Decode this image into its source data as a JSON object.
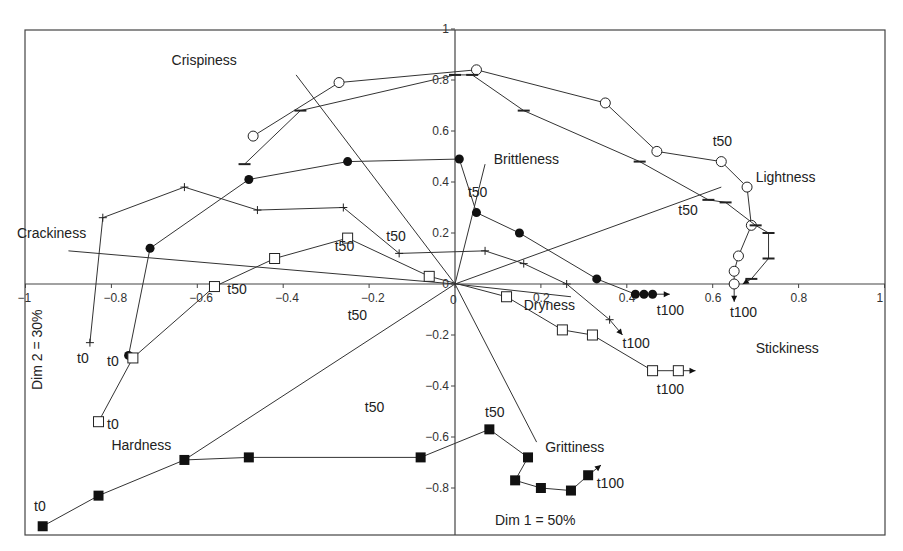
{
  "chart_data": {
    "type": "scatter",
    "subtype": "PCA biplot with time trajectories",
    "title": "",
    "xlabel": "Dim 1 = 50%",
    "ylabel": "Dim 2 = 30%",
    "xlim": [
      -1,
      1
    ],
    "ylim": [
      -1,
      1
    ],
    "grid": false,
    "legend": "none",
    "x_ticks": [
      "-1",
      "-0.8",
      "-0.6",
      "-0.4",
      "-0.2",
      "0",
      "0.2",
      "0.4",
      "0.6",
      "0.8",
      "1"
    ],
    "x_tick_values": [
      -1,
      -0.8,
      -0.6,
      -0.4,
      -0.2,
      0,
      0.2,
      0.4,
      0.6,
      0.8,
      1
    ],
    "y_ticks": [
      "1",
      "0.8",
      "0.6",
      "0.4",
      "0.2",
      "0",
      "-0.2",
      "-0.4",
      "-0.6",
      "-0.8"
    ],
    "y_tick_values": [
      1,
      0.8,
      0.6,
      0.4,
      0.2,
      0,
      -0.2,
      -0.4,
      -0.6,
      -0.8
    ],
    "attribute_vectors": [
      {
        "name": "Crispiness",
        "x": -0.37,
        "y": 0.82,
        "label_x": -0.66,
        "label_y": 0.86
      },
      {
        "name": "Brittleness",
        "x": 0.07,
        "y": 0.47,
        "label_x": 0.09,
        "label_y": 0.47
      },
      {
        "name": "Lightness",
        "x": 0.62,
        "y": 0.38,
        "label_x": 0.7,
        "label_y": 0.4
      },
      {
        "name": "Crackiness",
        "x": -0.9,
        "y": 0.13,
        "label_x": -1.02,
        "label_y": 0.18
      },
      {
        "name": "Dryness",
        "x": 0.27,
        "y": -0.05,
        "label_x": 0.16,
        "label_y": -0.1
      },
      {
        "name": "Grittiness",
        "x": 0.19,
        "y": -0.62,
        "label_x": 0.21,
        "label_y": -0.66
      },
      {
        "name": "Hardness",
        "x": -0.63,
        "y": -0.69,
        "label_x": -0.8,
        "label_y": -0.65
      },
      {
        "name": "Stickiness",
        "x": null,
        "y": null,
        "label_x": 0.7,
        "label_y": -0.27
      }
    ],
    "series": [
      {
        "name": "open-circle",
        "marker": "circle-open",
        "points": [
          [
            -0.47,
            0.58
          ],
          [
            -0.27,
            0.79
          ],
          [
            0.05,
            0.84
          ],
          [
            0.35,
            0.71
          ],
          [
            0.47,
            0.52
          ],
          [
            0.62,
            0.48
          ],
          [
            0.68,
            0.38
          ],
          [
            0.69,
            0.23
          ],
          [
            0.66,
            0.11
          ],
          [
            0.65,
            0.05
          ],
          [
            0.65,
            0.0
          ]
        ],
        "arrow_end": [
          0.65,
          -0.07
        ],
        "labels": [
          {
            "text": "t50",
            "x": 0.6,
            "y": 0.54
          },
          {
            "text": "t100",
            "x": 0.64,
            "y": -0.13
          }
        ]
      },
      {
        "name": "dash",
        "marker": "dash",
        "points": [
          [
            -0.49,
            0.47
          ],
          [
            -0.36,
            0.68
          ],
          [
            0.0,
            0.82
          ],
          [
            0.04,
            0.82
          ],
          [
            0.16,
            0.68
          ],
          [
            0.43,
            0.48
          ],
          [
            0.59,
            0.33
          ],
          [
            0.63,
            0.32
          ],
          [
            0.7,
            0.23
          ],
          [
            0.73,
            0.2
          ],
          [
            0.73,
            0.1
          ],
          [
            0.69,
            0.02
          ]
        ],
        "arrow_end": [
          0.67,
          0.0
        ],
        "labels": [
          {
            "text": "t50",
            "x": 0.52,
            "y": 0.27
          }
        ]
      },
      {
        "name": "filled-circle",
        "marker": "circle-filled",
        "points": [
          [
            -0.76,
            -0.28
          ],
          [
            -0.71,
            0.14
          ],
          [
            -0.48,
            0.41
          ],
          [
            -0.25,
            0.48
          ],
          [
            0.01,
            0.49
          ],
          [
            0.05,
            0.28
          ],
          [
            0.15,
            0.2
          ],
          [
            0.33,
            0.02
          ],
          [
            0.42,
            -0.04
          ],
          [
            0.44,
            -0.04
          ],
          [
            0.46,
            -0.04
          ]
        ],
        "arrow_end": [
          0.5,
          -0.04
        ],
        "labels": [
          {
            "text": "t0",
            "x": -0.81,
            "y": -0.32
          },
          {
            "text": "t50",
            "x": 0.03,
            "y": 0.34
          },
          {
            "text": "t100",
            "x": 0.47,
            "y": -0.12
          }
        ]
      },
      {
        "name": "plus",
        "marker": "plus",
        "points": [
          [
            -0.85,
            -0.23
          ],
          [
            -0.82,
            0.26
          ],
          [
            -0.63,
            0.38
          ],
          [
            -0.46,
            0.29
          ],
          [
            -0.26,
            0.3
          ],
          [
            -0.13,
            0.12
          ],
          [
            0.07,
            0.13
          ],
          [
            0.16,
            0.08
          ],
          [
            0.26,
            0.0
          ],
          [
            0.36,
            -0.14
          ]
        ],
        "arrow_end": [
          0.39,
          -0.2
        ],
        "labels": [
          {
            "text": "t0",
            "x": -0.88,
            "y": -0.31
          },
          {
            "text": "t50",
            "x": -0.16,
            "y": 0.17
          },
          {
            "text": "t100",
            "x": 0.39,
            "y": -0.25
          }
        ]
      },
      {
        "name": "open-square",
        "marker": "square-open",
        "points": [
          [
            -0.83,
            -0.54
          ],
          [
            -0.75,
            -0.29
          ],
          [
            -0.56,
            -0.01
          ],
          [
            -0.42,
            0.1
          ],
          [
            -0.25,
            0.18
          ],
          [
            -0.06,
            0.03
          ],
          [
            0.12,
            -0.05
          ],
          [
            0.25,
            -0.18
          ],
          [
            0.32,
            -0.2
          ],
          [
            0.46,
            -0.34
          ],
          [
            0.52,
            -0.34
          ]
        ],
        "arrow_end": [
          0.56,
          -0.34
        ],
        "labels": [
          {
            "text": "t0",
            "x": -0.81,
            "y": -0.57
          },
          {
            "text": "t50",
            "x": -0.53,
            "y": -0.04
          },
          {
            "text": "t50",
            "x": -0.28,
            "y": 0.13
          },
          {
            "text": "t100",
            "x": 0.47,
            "y": -0.43
          }
        ]
      },
      {
        "name": "filled-square",
        "marker": "square-filled",
        "points": [
          [
            -0.96,
            -0.95
          ],
          [
            -0.83,
            -0.83
          ],
          [
            -0.63,
            -0.69
          ],
          [
            -0.48,
            -0.68
          ],
          [
            -0.08,
            -0.68
          ],
          [
            0.08,
            -0.57
          ],
          [
            0.17,
            -0.68
          ],
          [
            0.14,
            -0.77
          ],
          [
            0.2,
            -0.8
          ],
          [
            0.27,
            -0.81
          ],
          [
            0.31,
            -0.75
          ]
        ],
        "arrow_end": [
          0.34,
          -0.71
        ],
        "labels": [
          {
            "text": "t0",
            "x": -0.98,
            "y": -0.89
          },
          {
            "text": "t50",
            "x": 0.07,
            "y": -0.52
          },
          {
            "text": "t100",
            "x": 0.33,
            "y": -0.8
          }
        ]
      }
    ],
    "free_labels": [
      {
        "text": "t50",
        "x": -0.25,
        "y": -0.14
      },
      {
        "text": "t50",
        "x": -0.21,
        "y": -0.5
      }
    ]
  },
  "dim_labels": {
    "x_axis": "Dim 1 = 50%",
    "y_axis": "Dim 2 = 30%"
  },
  "caption": "Figure 10.10 PCA of TDS curves..."
}
